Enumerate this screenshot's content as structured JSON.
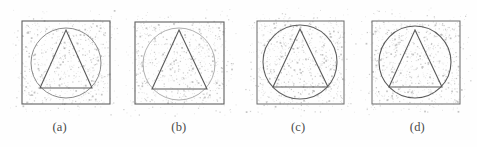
{
  "figure": {
    "background_color": "#fefefe",
    "width": 477,
    "height": 147,
    "shape_stroke_color": "#6b6b6b",
    "noise_dot_color": "#8d8d8d",
    "caption_color": "#4a4a4a"
  },
  "panels": [
    {
      "id": "panel-a",
      "caption": "(a)",
      "square": {
        "x": 22,
        "y": 21,
        "width": 88,
        "height": 83,
        "stroke": "#5f5f5f",
        "stroke_width": 1.1
      },
      "circle": {
        "cx": 66,
        "cy": 63,
        "r": 35,
        "stroke": "#8a8a8a",
        "stroke_width": 1.0
      },
      "triangle": {
        "apex_x": 66,
        "apex_y": 30,
        "base_left_x": 40,
        "base_right_x": 92,
        "base_y": 88,
        "stroke": "#5a5a5a",
        "stroke_width": 1.1
      },
      "noise": {
        "dots": 520,
        "seed": 11,
        "opacity": 0.55
      }
    },
    {
      "id": "panel-b",
      "caption": "(b)",
      "square": {
        "x": 16,
        "y": 22,
        "width": 89,
        "height": 82,
        "stroke": "#5f5f5f",
        "stroke_width": 1.1
      },
      "circle": {
        "cx": 60,
        "cy": 64,
        "r": 36,
        "stroke": "#b0b0b0",
        "stroke_width": 1.0
      },
      "triangle": {
        "apex_x": 60,
        "apex_y": 30,
        "base_left_x": 33,
        "base_right_x": 88,
        "base_y": 89,
        "stroke": "#5a5a5a",
        "stroke_width": 1.1
      },
      "noise": {
        "dots": 560,
        "seed": 29,
        "opacity": 0.55
      }
    },
    {
      "id": "panel-c",
      "caption": "(c)",
      "square": {
        "x": 18,
        "y": 21,
        "width": 87,
        "height": 83,
        "stroke": "#6a6a6a",
        "stroke_width": 1.0
      },
      "circle": {
        "cx": 61,
        "cy": 62,
        "r": 37,
        "stroke": "#5f5f5f",
        "stroke_width": 1.1
      },
      "triangle": {
        "apex_x": 61,
        "apex_y": 29,
        "base_left_x": 34,
        "base_right_x": 89,
        "base_y": 87,
        "stroke": "#5a5a5a",
        "stroke_width": 1.1
      },
      "noise": {
        "dots": 610,
        "seed": 47,
        "opacity": 0.55
      }
    },
    {
      "id": "panel-d",
      "caption": "(d)",
      "square": {
        "x": 14,
        "y": 21,
        "width": 88,
        "height": 83,
        "stroke": "#6a6a6a",
        "stroke_width": 1.0
      },
      "circle": {
        "cx": 57,
        "cy": 62,
        "r": 36,
        "stroke": "#5a5a5a",
        "stroke_width": 1.1
      },
      "triangle": {
        "apex_x": 57,
        "apex_y": 30,
        "base_left_x": 31,
        "base_right_x": 84,
        "base_y": 87,
        "stroke": "#5a5a5a",
        "stroke_width": 1.1
      },
      "noise": {
        "dots": 590,
        "seed": 73,
        "opacity": 0.55
      }
    }
  ]
}
